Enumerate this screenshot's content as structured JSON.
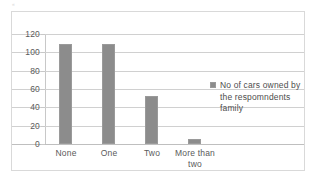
{
  "artifact": {
    "top_left_mark": "«"
  },
  "chart_data": {
    "type": "bar",
    "title": "",
    "xlabel": "",
    "ylabel": "",
    "categories": [
      "None",
      "One",
      "Two",
      "More than two"
    ],
    "values": [
      109,
      109,
      52,
      5
    ],
    "series": [
      {
        "name": "No of cars owned by the respomndents family",
        "values": [
          109,
          109,
          52,
          5
        ]
      }
    ],
    "ylim": [
      0,
      120
    ],
    "yticks": [
      0,
      20,
      40,
      60,
      80,
      100,
      120
    ],
    "ytick_labels": [
      "0",
      "20",
      "40",
      "60",
      "80",
      "100",
      "120"
    ],
    "grid": true,
    "legend_position": "right",
    "legend_entries": [
      "No of cars owned by the respomndents family"
    ],
    "colors": {
      "bar": "#8c8c8c",
      "bar_border": "#9a9a9a",
      "gridline": "#d0d0d0",
      "axis": "#c8c8c8",
      "text": "#5a5a5a",
      "frame": "#d9d9d9",
      "background": "#ffffff"
    }
  },
  "legend": {
    "label": "No of cars owned by the respomndents family"
  }
}
